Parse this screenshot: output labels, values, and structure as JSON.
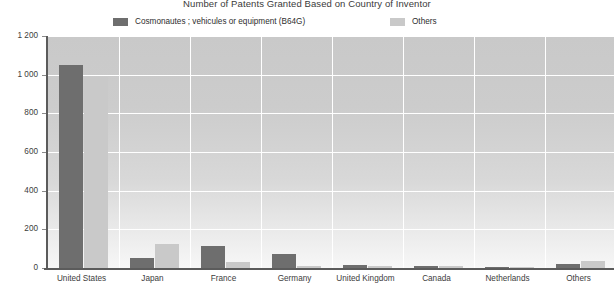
{
  "chart_data": {
    "type": "bar",
    "title": "Number of Patents Granted Based on Country of Inventor",
    "xlabel": "",
    "ylabel": "",
    "ylim": [
      0,
      1200
    ],
    "yticks": [
      "0",
      "200",
      "400",
      "600",
      "800",
      "1 000",
      "1 200"
    ],
    "ytick_values": [
      0,
      200,
      400,
      600,
      800,
      1000,
      1200
    ],
    "grid": true,
    "legend_position": "top",
    "categories": [
      "United States",
      "Japan",
      "France",
      "Germany",
      "United Kingdom",
      "Canada",
      "Netherlands",
      "Others"
    ],
    "series": [
      {
        "name": "Cosmonautes ; vehicules or equipment (B64G)",
        "color": "#6e6e6e",
        "values": [
          1050,
          52,
          115,
          72,
          14,
          12,
          5,
          22
        ]
      },
      {
        "name": "Others",
        "color": "#c9c9c9",
        "values": [
          990,
          122,
          30,
          12,
          10,
          9,
          4,
          38
        ]
      }
    ]
  },
  "legend": {
    "items": [
      {
        "label": "Cosmonautes ; vehicules or equipment (B64G)",
        "color": "#6e6e6e"
      },
      {
        "label": "Others",
        "color": "#c9c9c9"
      }
    ]
  },
  "colors": {
    "series_dark": "#6e6e6e",
    "series_light": "#c9c9c9",
    "axis": "#5b5b5b",
    "gridline": "#ffffff",
    "text": "#3c3c3c",
    "plot_bg_top": "#c9c9c9",
    "plot_bg_bottom": "#f7f7f7"
  }
}
